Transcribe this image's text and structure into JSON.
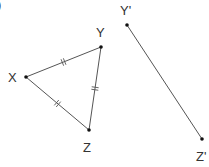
{
  "diagram": {
    "corner_mark": ")",
    "points": {
      "X": {
        "label": "X",
        "x": 26,
        "y": 77,
        "lx": 8,
        "ly": 82
      },
      "Y": {
        "label": "Y",
        "x": 101,
        "y": 47,
        "lx": 96,
        "ly": 37
      },
      "Z": {
        "label": "Z",
        "x": 89,
        "y": 130,
        "lx": 83,
        "ly": 152
      },
      "Yp": {
        "label": "Y'",
        "x": 127,
        "y": 25,
        "lx": 120,
        "ly": 15
      },
      "Zp": {
        "label": "Z'",
        "x": 202,
        "y": 139,
        "lx": 196,
        "ly": 161
      }
    },
    "segments": [
      {
        "name": "XY",
        "from": "X",
        "to": "Y",
        "ticks": 2
      },
      {
        "name": "YZ",
        "from": "Y",
        "to": "Z",
        "ticks": 2
      },
      {
        "name": "XZ",
        "from": "X",
        "to": "Z",
        "ticks": 2
      },
      {
        "name": "Y'Z'",
        "from": "Yp",
        "to": "Zp",
        "ticks": 0
      }
    ],
    "colors": {
      "line": "#555555",
      "point": "#111111",
      "label": "#333333"
    }
  }
}
